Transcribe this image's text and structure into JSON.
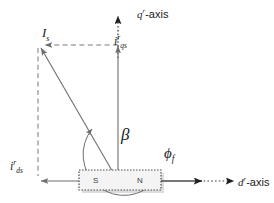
{
  "diagram": {
    "axes": {
      "q_axis_label": "q",
      "q_axis_suffix": "-axis",
      "q_axis_superscript": "r",
      "d_axis_label": "d",
      "d_axis_suffix": "-axis",
      "d_axis_superscript": "r"
    },
    "vectors": {
      "stator_current": {
        "symbol": "I",
        "subscript": "s"
      },
      "q_current": {
        "symbol": "i",
        "superscript": "r",
        "subscript": "qs"
      },
      "d_current": {
        "symbol": "i",
        "superscript": "r",
        "subscript": "ds"
      },
      "flux": {
        "symbol": "ϕ",
        "subscript": "f"
      }
    },
    "angle": {
      "symbol": "β"
    },
    "magnet": {
      "south_pole": "S",
      "north_pole": "N"
    },
    "colors": {
      "line": "#6e6e6e",
      "dashed": "#7a7a7a",
      "text": "#1a1a1a",
      "magnet_fill": "#f2f2f2",
      "magnet_border": "#4d4d4d",
      "magnet_shadow": "#cfcfcf"
    }
  }
}
